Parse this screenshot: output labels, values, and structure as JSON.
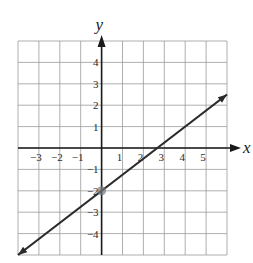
{
  "chart_data": {
    "type": "line",
    "title": "",
    "xlabel": "x",
    "ylabel": "y",
    "xlim": [
      -4,
      6
    ],
    "ylim": [
      -5,
      5
    ],
    "grid": true,
    "x_ticks": [
      -3,
      -2,
      -1,
      1,
      2,
      3,
      4,
      5
    ],
    "y_ticks": [
      -4,
      -3,
      -2,
      -1,
      1,
      2,
      3,
      4
    ],
    "x_tick_labels": [
      "−3",
      "−2",
      "−1",
      "1",
      "2",
      "3",
      "4",
      "5"
    ],
    "y_tick_labels": [
      "−4",
      "−3",
      "−2",
      "−1",
      "1",
      "2",
      "3",
      "4"
    ],
    "series": [
      {
        "name": "line",
        "equation": "y = (3/4)x - 2",
        "slope": 0.75,
        "intercept": -2,
        "x": [
          -4,
          6
        ],
        "y": [
          -5,
          2.5
        ],
        "arrows_both_ends": true
      }
    ],
    "annotations": [
      {
        "type": "point",
        "x": 0,
        "y": -2,
        "label": "y-intercept"
      }
    ]
  },
  "colors": {
    "grid": "#9a9a9a",
    "axis": "#1a1a1a",
    "line": "#2a2a2a",
    "point": "#777777"
  }
}
